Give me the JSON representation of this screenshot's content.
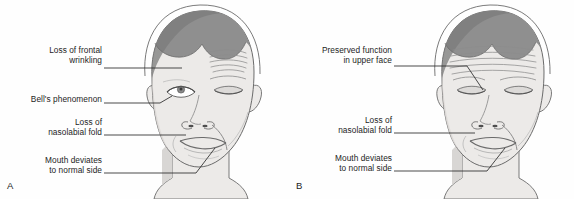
{
  "figure": {
    "background_color": "#fefefe",
    "ink_color": "#1d1d1d",
    "hair_color": "#8f8f8f",
    "hair_shadow_color": "#777777",
    "skin_color": "#eceae8",
    "skin_shadow_color": "#d8d6d4",
    "outline_color": "#6b6b6b"
  },
  "panels": [
    {
      "id": "A",
      "letter": "A",
      "caption": "Peripheral facial nerve lesion",
      "labels": [
        {
          "name": "loss-of-frontal-wrinkling",
          "lines": [
            "Loss of frontal",
            "wrinkling"
          ],
          "text": "Loss of frontal\nwrinkling",
          "x": 18,
          "y": 45,
          "width": 84,
          "leader": {
            "x1": 104,
            "y1": 68,
            "x2": 182,
            "y2": 68
          }
        },
        {
          "name": "bells-phenomenon",
          "lines": [
            "Bell's phenomenon"
          ],
          "text": "Bell's phenomenon",
          "x": 5,
          "y": 94,
          "width": 97,
          "leader": {
            "x1": 104,
            "y1": 103,
            "x2": 172,
            "y2": 97
          }
        },
        {
          "name": "loss-of-nasolabial-fold",
          "lines": [
            "Loss of",
            "nasolabial fold"
          ],
          "text": "Loss of\nnasolabial fold",
          "x": 18,
          "y": 117,
          "width": 84,
          "leader": {
            "x1": 104,
            "y1": 135,
            "x2": 186,
            "y2": 135
          }
        },
        {
          "name": "mouth-deviates-to-normal-side",
          "lines": [
            "Mouth deviates",
            "to normal side"
          ],
          "text": "Mouth deviates\nto normal side",
          "x": 15,
          "y": 155,
          "width": 87,
          "leader": {
            "x1": 104,
            "y1": 173,
            "x2": 205,
            "y2": 173
          }
        }
      ]
    },
    {
      "id": "B",
      "letter": "B",
      "caption": "Central facial nerve lesion",
      "labels": [
        {
          "name": "preserved-function-in-upper-face",
          "lines": [
            "Preserved function",
            "in upper face"
          ],
          "text": "Preserved function\nin upper face",
          "x": 10,
          "y": 45,
          "width": 95,
          "leader": {
            "x1": 107,
            "y1": 66,
            "x2": 186,
            "y2": 66
          }
        },
        {
          "name": "loss-of-nasolabial-fold",
          "lines": [
            "Loss of",
            "nasolabial fold"
          ],
          "text": "Loss of\nnasolabial fold",
          "x": 21,
          "y": 115,
          "width": 84,
          "leader": {
            "x1": 107,
            "y1": 133,
            "x2": 188,
            "y2": 133
          }
        },
        {
          "name": "mouth-deviates-to-normal-side",
          "lines": [
            "Mouth deviates",
            "to normal side"
          ],
          "text": "Mouth deviates\nto normal side",
          "x": 18,
          "y": 153,
          "width": 87,
          "leader": {
            "x1": 107,
            "y1": 171,
            "x2": 207,
            "y2": 171
          }
        }
      ]
    }
  ]
}
